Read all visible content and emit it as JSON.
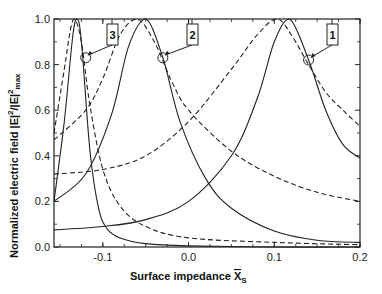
{
  "chart_data": {
    "type": "line",
    "title": "",
    "xlabel": "Surface impedance X̄s",
    "xlabel_main": "Surface impedance ",
    "xlabel_symbol": "X",
    "xlabel_sub": "S",
    "ylabel": "Normalized electric field |E|²/|E|²max",
    "ylabel_main": "Normalized electric field |E|",
    "ylabel_sup1": "2",
    "ylabel_mid": "/|E|",
    "ylabel_sup2": "2",
    "ylabel_sub": "max",
    "xlim": [
      -0.157,
      0.2
    ],
    "ylim": [
      0.0,
      1.0
    ],
    "xticks": [
      -0.1,
      0.0,
      0.1,
      0.2
    ],
    "xtick_labels": [
      "-0.1",
      "0.0",
      "0.1",
      "0.2"
    ],
    "yticks": [
      0.0,
      0.2,
      0.4,
      0.6,
      0.8,
      1.0
    ],
    "ytick_labels": [
      "0.0",
      "0.2",
      "0.4",
      "0.6",
      "0.8",
      "1.0"
    ],
    "grid": false,
    "legend": "none; curves identified by numbered callouts",
    "series": [
      {
        "name": "1 (solid)",
        "style": "solid",
        "peak_x": 0.118,
        "peak_y": 1.0,
        "x": [
          -0.157,
          -0.1,
          -0.05,
          0.0,
          0.05,
          0.08,
          0.1,
          0.118,
          0.14,
          0.16,
          0.18,
          0.2
        ],
        "values": [
          0.075,
          0.09,
          0.12,
          0.2,
          0.4,
          0.65,
          0.9,
          1.0,
          0.82,
          0.6,
          0.45,
          0.39
        ]
      },
      {
        "name": "1 (dashed)",
        "style": "dashed",
        "peak_x": 0.103,
        "peak_y": 1.0,
        "x": [
          -0.157,
          -0.1,
          -0.05,
          0.0,
          0.05,
          0.08,
          0.103,
          0.12,
          0.14,
          0.16,
          0.18,
          0.2
        ],
        "values": [
          0.32,
          0.34,
          0.4,
          0.55,
          0.78,
          0.93,
          1.0,
          0.93,
          0.8,
          0.68,
          0.6,
          0.53
        ]
      },
      {
        "name": "2 (solid)",
        "style": "solid",
        "peak_x": -0.05,
        "peak_y": 1.0,
        "x": [
          -0.157,
          -0.12,
          -0.09,
          -0.07,
          -0.05,
          -0.03,
          -0.01,
          0.02,
          0.05,
          0.1,
          0.15,
          0.2
        ],
        "values": [
          0.2,
          0.32,
          0.58,
          0.88,
          1.0,
          0.83,
          0.55,
          0.3,
          0.17,
          0.07,
          0.03,
          0.02
        ]
      },
      {
        "name": "2 (dashed)",
        "style": "dashed",
        "peak_x": -0.06,
        "peak_y": 1.0,
        "x": [
          -0.157,
          -0.12,
          -0.1,
          -0.08,
          -0.06,
          -0.04,
          -0.02,
          0.0,
          0.05,
          0.1,
          0.15,
          0.2
        ],
        "values": [
          0.47,
          0.6,
          0.74,
          0.93,
          1.0,
          0.9,
          0.73,
          0.6,
          0.42,
          0.31,
          0.24,
          0.2
        ]
      },
      {
        "name": "3 (solid)",
        "style": "solid",
        "peak_x": -0.13,
        "peak_y": 1.0,
        "x": [
          -0.157,
          -0.145,
          -0.135,
          -0.13,
          -0.125,
          -0.115,
          -0.105,
          -0.095,
          -0.08,
          -0.05,
          0.0,
          0.1,
          0.2
        ],
        "values": [
          0.2,
          0.55,
          0.93,
          1.0,
          0.9,
          0.42,
          0.17,
          0.08,
          0.04,
          0.015,
          0.005,
          0.0,
          0.0
        ]
      },
      {
        "name": "3 (dashed)",
        "style": "dashed",
        "peak_x": -0.133,
        "peak_y": 1.0,
        "x": [
          -0.157,
          -0.145,
          -0.138,
          -0.133,
          -0.125,
          -0.115,
          -0.1,
          -0.08,
          -0.05,
          0.0,
          0.1,
          0.2
        ],
        "values": [
          0.5,
          0.78,
          0.95,
          1.0,
          0.9,
          0.62,
          0.34,
          0.18,
          0.09,
          0.04,
          0.02,
          0.01
        ]
      }
    ],
    "annotations": [
      {
        "label": "1",
        "marker_x": 0.14,
        "marker_y": 0.82
      },
      {
        "label": "2",
        "marker_x": -0.03,
        "marker_y": 0.83
      },
      {
        "label": "3",
        "marker_x": -0.12,
        "marker_y": 0.83
      }
    ]
  }
}
